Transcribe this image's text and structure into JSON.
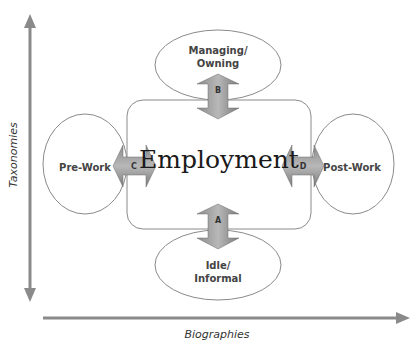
{
  "diagram": {
    "center": "Employment",
    "nodes": {
      "top": [
        "Managing/",
        "Owning"
      ],
      "left": "Pre-Work",
      "right": "Post-Work",
      "bottom": [
        "Idle/",
        "Informal"
      ]
    },
    "arrows": {
      "top": "B",
      "left": "C",
      "right": "D",
      "bottom": "A"
    },
    "axes": {
      "y": "Taxonomies",
      "x": "Biographies"
    }
  }
}
